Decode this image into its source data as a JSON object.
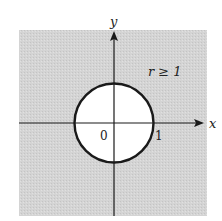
{
  "diagram": {
    "region_label": "r ≥ 1",
    "x_axis_label": "x",
    "y_axis_label": "y",
    "origin_label": "0",
    "unit_label": "1",
    "colors": {
      "shaded_region": "#d2d2d2",
      "circle_interior": "#ffffff",
      "stroke": "#1a1a1a",
      "background": "#ffffff"
    }
  }
}
